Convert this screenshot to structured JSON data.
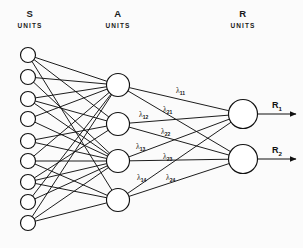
{
  "figure": {
    "kind": "neural-network-diagram",
    "background_color": "#fbfbfb",
    "ink_color": "#111111",
    "width": 303,
    "height": 248
  },
  "layers": [
    {
      "id": "s",
      "title": "S",
      "subtitle": "UNITS",
      "title_x": 30,
      "subtitle_x": 30,
      "unit_count": 9,
      "radius": 7.5,
      "cx": 28,
      "cys": [
        55,
        77,
        99,
        119,
        141,
        161,
        182,
        202,
        223
      ]
    },
    {
      "id": "a",
      "title": "A",
      "subtitle": "UNITS",
      "title_x": 118,
      "subtitle_x": 118,
      "unit_count": 4,
      "radius": 11.5,
      "cx": 118,
      "cys": [
        85,
        124,
        161,
        200
      ]
    },
    {
      "id": "r",
      "title": "R",
      "subtitle": "UNITS",
      "title_x": 243,
      "subtitle_x": 243,
      "unit_count": 2,
      "radius": 14.5,
      "cx": 243,
      "cys": [
        114,
        159
      ]
    }
  ],
  "title_y": 17,
  "subtitle_y": 28,
  "sa_edges": [
    [
      0,
      0
    ],
    [
      0,
      1
    ],
    [
      0,
      3
    ],
    [
      1,
      0
    ],
    [
      1,
      2
    ],
    [
      2,
      0
    ],
    [
      2,
      1
    ],
    [
      2,
      2
    ],
    [
      3,
      0
    ],
    [
      3,
      2
    ],
    [
      4,
      1
    ],
    [
      4,
      2
    ],
    [
      5,
      0
    ],
    [
      5,
      2
    ],
    [
      5,
      3
    ],
    [
      6,
      1
    ],
    [
      6,
      2
    ],
    [
      6,
      3
    ],
    [
      7,
      0
    ],
    [
      7,
      2
    ],
    [
      8,
      0
    ],
    [
      8,
      2
    ],
    [
      8,
      3
    ]
  ],
  "ar_edges": [
    [
      0,
      0
    ],
    [
      0,
      1
    ],
    [
      1,
      0
    ],
    [
      1,
      1
    ],
    [
      2,
      0
    ],
    [
      2,
      1
    ],
    [
      3,
      0
    ],
    [
      3,
      1
    ]
  ],
  "weights": [
    {
      "name": "lambda-1-1",
      "symbol": "λ",
      "sub": "11",
      "x": 176,
      "y": 93
    },
    {
      "name": "lambda-2-1",
      "symbol": "λ",
      "sub": "21",
      "x": 163,
      "y": 112
    },
    {
      "name": "lambda-1-2",
      "symbol": "λ",
      "sub": "12",
      "x": 139,
      "y": 117
    },
    {
      "name": "lambda-2-2",
      "symbol": "λ",
      "sub": "22",
      "x": 161,
      "y": 134
    },
    {
      "name": "lambda-1-3",
      "symbol": "λ",
      "sub": "13",
      "x": 136,
      "y": 149
    },
    {
      "name": "lambda-2-3",
      "symbol": "λ",
      "sub": "23",
      "x": 163,
      "y": 159
    },
    {
      "name": "lambda-1-4",
      "symbol": "λ",
      "sub": "14",
      "x": 137,
      "y": 180
    },
    {
      "name": "lambda-2-4",
      "symbol": "λ",
      "sub": "24",
      "x": 166,
      "y": 180
    }
  ],
  "outputs": [
    {
      "name": "output-r1",
      "symbol": "R",
      "sub": "1",
      "label_x": 272,
      "label_y": 108,
      "line_y": 114,
      "line_x1": 258,
      "line_x2": 296
    },
    {
      "name": "output-r2",
      "symbol": "R",
      "sub": "2",
      "label_x": 272,
      "label_y": 153,
      "line_y": 159,
      "line_x1": 258,
      "line_x2": 296
    }
  ]
}
